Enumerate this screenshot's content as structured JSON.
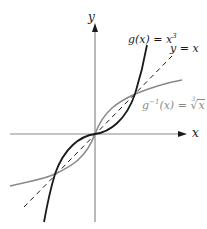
{
  "figure": {
    "axes": {
      "x_label": "x",
      "y_label": "y",
      "axis_color": "#8a8a8a"
    },
    "labels": {
      "g_function": {
        "name": "g",
        "lhs": "g(x) = x",
        "exponent": "3",
        "color": "#1a1a1a"
      },
      "identity": {
        "text": "y = x",
        "color": "#1a1a1a"
      },
      "g_inverse": {
        "lhs_prefix": "g",
        "superscript": "−1",
        "lhs_suffix": "(x) = ",
        "root_index": "3",
        "radicand": "x",
        "color": "#8a8a8a"
      }
    },
    "curves": [
      {
        "name": "g(x) = x^3",
        "style": "solid",
        "color": "#1a1a1a"
      },
      {
        "name": "y = x",
        "style": "dashed",
        "color": "#1a1a1a"
      },
      {
        "name": "g^-1(x) = cbrt(x)",
        "style": "solid",
        "color": "#8a8a8a"
      }
    ],
    "intersections": [
      "(-1, -1)",
      "(0, 0)",
      "(1, 1)"
    ]
  }
}
